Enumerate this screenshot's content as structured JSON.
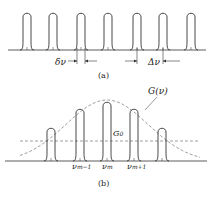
{
  "panel_a": {
    "caption": "(a)",
    "delta_small_label": "δν",
    "delta_large_label": "Δν",
    "peak_x": [
      27,
      53,
      81,
      108,
      137,
      163,
      191
    ]
  },
  "panel_b": {
    "caption": "(b)",
    "gain_curve_label": "G(ν)",
    "threshold_label": "G",
    "threshold_sub": "0",
    "mode_labels": [
      {
        "main": "ν",
        "sub": "m−1"
      },
      {
        "main": "ν",
        "sub": "m"
      },
      {
        "main": "ν",
        "sub": "m+1"
      }
    ],
    "peaks": [
      {
        "x": 51,
        "top": 128
      },
      {
        "x": 80,
        "top": 109
      },
      {
        "x": 107,
        "top": 102
      },
      {
        "x": 134,
        "top": 109
      },
      {
        "x": 162,
        "top": 128
      }
    ]
  },
  "colors": {
    "line": "#333333",
    "dashed": "#777777"
  }
}
